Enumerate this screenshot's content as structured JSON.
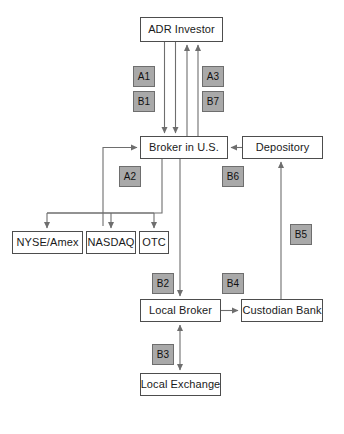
{
  "diagram": {
    "colors": {
      "node_fill": "#ffffff",
      "node_border": "#4d4d4d",
      "tag_fill": "#a9a9a9",
      "tag_border": "#6e6e6e",
      "line": "#6e6e6e",
      "text": "#1a1a1a",
      "background": "#ffffff"
    },
    "nodes": [
      {
        "id": "adr_investor",
        "label": "ADR Investor",
        "x": 140,
        "y": 17,
        "w": 83,
        "h": 25
      },
      {
        "id": "broker_us",
        "label": "Broker in U.S.",
        "x": 140,
        "y": 136,
        "w": 88,
        "h": 23
      },
      {
        "id": "depository",
        "label": "Depository",
        "x": 242,
        "y": 136,
        "w": 81,
        "h": 23
      },
      {
        "id": "nyse_amex",
        "label": "NYSE/Amex",
        "x": 12,
        "y": 231,
        "w": 71,
        "h": 23
      },
      {
        "id": "nasdaq",
        "label": "NASDAQ",
        "x": 86,
        "y": 231,
        "w": 50,
        "h": 23
      },
      {
        "id": "otc",
        "label": "OTC",
        "x": 139,
        "y": 231,
        "w": 30,
        "h": 23
      },
      {
        "id": "local_broker",
        "label": "Local Broker",
        "x": 140,
        "y": 299,
        "w": 81,
        "h": 23
      },
      {
        "id": "custodian",
        "label": "Custodian Bank",
        "x": 241,
        "y": 299,
        "w": 82,
        "h": 23
      },
      {
        "id": "local_exchange",
        "label": "Local Exchange",
        "x": 140,
        "y": 373,
        "w": 81,
        "h": 23
      }
    ],
    "tags": [
      {
        "id": "a1",
        "label": "A1",
        "x": 133,
        "y": 66,
        "w": 22,
        "h": 21
      },
      {
        "id": "b1",
        "label": "B1",
        "x": 133,
        "y": 91,
        "w": 22,
        "h": 21
      },
      {
        "id": "a3",
        "label": "A3",
        "x": 202,
        "y": 66,
        "w": 22,
        "h": 21
      },
      {
        "id": "b7",
        "label": "B7",
        "x": 202,
        "y": 91,
        "w": 22,
        "h": 21
      },
      {
        "id": "a2",
        "label": "A2",
        "x": 119,
        "y": 166,
        "w": 22,
        "h": 21
      },
      {
        "id": "b6",
        "label": "B6",
        "x": 222,
        "y": 166,
        "w": 22,
        "h": 21
      },
      {
        "id": "b5",
        "label": "B5",
        "x": 290,
        "y": 224,
        "w": 22,
        "h": 21
      },
      {
        "id": "b2",
        "label": "B2",
        "x": 152,
        "y": 273,
        "w": 22,
        "h": 21
      },
      {
        "id": "b4",
        "label": "B4",
        "x": 222,
        "y": 273,
        "w": 22,
        "h": 21
      },
      {
        "id": "b3",
        "label": "B3",
        "x": 152,
        "y": 344,
        "w": 22,
        "h": 21
      }
    ],
    "edges": [
      {
        "id": "adr-to-broker-1",
        "from": "adr_investor",
        "to": "broker_us",
        "direction": "down"
      },
      {
        "id": "adr-to-broker-2",
        "from": "adr_investor",
        "to": "broker_us",
        "direction": "down"
      },
      {
        "id": "broker-to-adr-1",
        "from": "broker_us",
        "to": "adr_investor",
        "direction": "up"
      },
      {
        "id": "broker-to-adr-2",
        "from": "broker_us",
        "to": "adr_investor",
        "direction": "up"
      },
      {
        "id": "depository-to-broker",
        "from": "depository",
        "to": "broker_us",
        "direction": "left"
      },
      {
        "id": "broker-to-nyse",
        "from": "broker_us",
        "to": "nyse_amex",
        "direction": "down"
      },
      {
        "id": "broker-to-nasdaq",
        "from": "broker_us",
        "to": "nasdaq",
        "direction": "down"
      },
      {
        "id": "broker-to-otc",
        "from": "broker_us",
        "to": "otc",
        "direction": "down"
      },
      {
        "id": "exchanges-to-broker",
        "from": "exchanges",
        "to": "broker_us",
        "direction": "right"
      },
      {
        "id": "broker-to-local-broker",
        "from": "broker_us",
        "to": "local_broker",
        "direction": "down"
      },
      {
        "id": "local-broker-to-custodian",
        "from": "local_broker",
        "to": "custodian",
        "direction": "right"
      },
      {
        "id": "custodian-to-depository",
        "from": "custodian",
        "to": "depository",
        "direction": "up"
      },
      {
        "id": "local-broker-local-exchange",
        "from": "local_broker",
        "to": "local_exchange",
        "direction": "both"
      }
    ]
  }
}
